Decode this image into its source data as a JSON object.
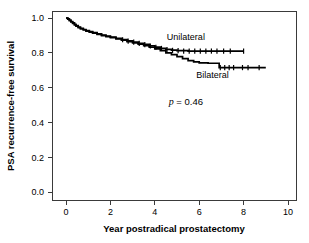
{
  "chart_data": {
    "type": "line",
    "title": "",
    "xlabel": "Year postradical prostatectomy",
    "ylabel": "PSA recurrence-free survival",
    "xlim": [
      -0.5,
      10.5
    ],
    "ylim": [
      0.0,
      1.0
    ],
    "xticks": [
      0,
      2,
      4,
      6,
      8,
      10
    ],
    "xtick_labels": [
      "0",
      "2",
      "4",
      "6",
      "8",
      "10"
    ],
    "yticks": [
      0.0,
      0.2,
      0.4,
      0.6,
      0.8,
      1.0
    ],
    "ytick_labels": [
      "0.0",
      "0.2",
      "0.4",
      "0.6",
      "0.8",
      "1.0"
    ],
    "grid": false,
    "legend_position": "inline-annotation",
    "annotations": [
      {
        "name": "p-value",
        "text_italic": "p",
        "text": " = 0.46",
        "x": 5.4,
        "y": 0.5
      }
    ],
    "series": [
      {
        "name": "Unilateral",
        "label_x": 5.4,
        "label_y": 0.875,
        "points": [
          [
            0.0,
            1.0
          ],
          [
            0.08,
            0.995
          ],
          [
            0.15,
            0.988
          ],
          [
            0.22,
            0.98
          ],
          [
            0.3,
            0.972
          ],
          [
            0.38,
            0.963
          ],
          [
            0.45,
            0.956
          ],
          [
            0.55,
            0.948
          ],
          [
            0.65,
            0.941
          ],
          [
            0.78,
            0.934
          ],
          [
            0.9,
            0.928
          ],
          [
            1.05,
            0.922
          ],
          [
            1.2,
            0.916
          ],
          [
            1.4,
            0.909
          ],
          [
            1.6,
            0.902
          ],
          [
            1.8,
            0.896
          ],
          [
            2.0,
            0.89
          ],
          [
            2.25,
            0.883
          ],
          [
            2.5,
            0.876
          ],
          [
            2.75,
            0.868
          ],
          [
            3.0,
            0.862
          ],
          [
            3.25,
            0.855
          ],
          [
            3.5,
            0.848
          ],
          [
            3.75,
            0.84
          ],
          [
            4.0,
            0.833
          ],
          [
            4.25,
            0.826
          ],
          [
            4.5,
            0.82
          ],
          [
            4.75,
            0.815
          ],
          [
            5.0,
            0.812
          ],
          [
            5.5,
            0.81
          ],
          [
            6.0,
            0.81
          ],
          [
            7.0,
            0.81
          ],
          [
            8.0,
            0.81
          ]
        ],
        "censored": [
          [
            2.55,
            0.875
          ],
          [
            2.8,
            0.867
          ],
          [
            3.05,
            0.861
          ],
          [
            3.3,
            0.854
          ],
          [
            3.55,
            0.847
          ],
          [
            3.8,
            0.839
          ],
          [
            4.05,
            0.832
          ],
          [
            4.3,
            0.825
          ],
          [
            4.55,
            0.819
          ],
          [
            4.8,
            0.814
          ],
          [
            5.05,
            0.812
          ],
          [
            5.3,
            0.81
          ],
          [
            5.55,
            0.81
          ],
          [
            5.8,
            0.81
          ],
          [
            6.05,
            0.81
          ],
          [
            6.3,
            0.81
          ],
          [
            6.55,
            0.81
          ],
          [
            6.8,
            0.81
          ],
          [
            7.1,
            0.81
          ],
          [
            7.4,
            0.81
          ],
          [
            8.0,
            0.81
          ]
        ]
      },
      {
        "name": "Bilateral",
        "label_x": 6.6,
        "label_y": 0.655,
        "points": [
          [
            0.0,
            1.0
          ],
          [
            0.08,
            0.993
          ],
          [
            0.15,
            0.985
          ],
          [
            0.22,
            0.977
          ],
          [
            0.3,
            0.969
          ],
          [
            0.38,
            0.96
          ],
          [
            0.45,
            0.953
          ],
          [
            0.55,
            0.945
          ],
          [
            0.65,
            0.938
          ],
          [
            0.78,
            0.931
          ],
          [
            0.9,
            0.925
          ],
          [
            1.05,
            0.919
          ],
          [
            1.2,
            0.913
          ],
          [
            1.4,
            0.906
          ],
          [
            1.6,
            0.899
          ],
          [
            1.8,
            0.893
          ],
          [
            2.0,
            0.887
          ],
          [
            2.25,
            0.88
          ],
          [
            2.5,
            0.872
          ],
          [
            2.75,
            0.864
          ],
          [
            3.0,
            0.857
          ],
          [
            3.25,
            0.849
          ],
          [
            3.5,
            0.841
          ],
          [
            3.75,
            0.832
          ],
          [
            4.0,
            0.823
          ],
          [
            4.25,
            0.812
          ],
          [
            4.5,
            0.8
          ],
          [
            4.75,
            0.79
          ],
          [
            5.0,
            0.778
          ],
          [
            5.25,
            0.766
          ],
          [
            5.5,
            0.755
          ],
          [
            5.75,
            0.748
          ],
          [
            6.0,
            0.742
          ],
          [
            6.4,
            0.74
          ],
          [
            6.85,
            0.74
          ],
          [
            6.9,
            0.715
          ],
          [
            7.6,
            0.715
          ],
          [
            8.6,
            0.715
          ],
          [
            9.0,
            0.715
          ]
        ],
        "censored": [
          [
            6.95,
            0.715
          ],
          [
            7.15,
            0.715
          ],
          [
            7.35,
            0.715
          ],
          [
            7.55,
            0.715
          ],
          [
            7.95,
            0.715
          ],
          [
            8.2,
            0.715
          ],
          [
            8.7,
            0.715
          ]
        ]
      }
    ]
  }
}
